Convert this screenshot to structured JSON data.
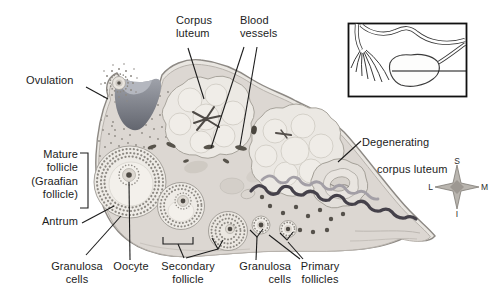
{
  "figure": {
    "labels": {
      "ovulation": "Ovulation",
      "corpus_luteum": "Corpus\nluteum",
      "blood_vessels": "Blood\nvessels",
      "degenerating_corpus_luteum_line1": "Degenerating",
      "degenerating_corpus_luteum_line2": "corpus luteum",
      "mature_follicle": "Mature\nfollicle\n(Graafian\nfollicle)",
      "antrum": "Antrum",
      "granulosa_cells_left": "Granulosa\ncells",
      "oocyte": "Oocyte",
      "secondary_follicle": "Secondary\nfollicle",
      "granulosa_cells_right": "Granulosa\ncells",
      "primary_follicles": "Primary\nfollicles"
    },
    "compass": {
      "top": "S",
      "left": "L",
      "right": "M",
      "bottom": "I"
    },
    "colors": {
      "background": "#ffffff",
      "label_text": "#1c1c1c",
      "ovary_rim": "#e9e6e1",
      "ovary_body": "#dcd7d2",
      "outline": "#8d8984",
      "crater_dark": "#6a6e78",
      "vessel_dark": "#45414a",
      "follicle_speckle": "#8d8983",
      "oocyte_dark": "#4e4a44"
    }
  }
}
